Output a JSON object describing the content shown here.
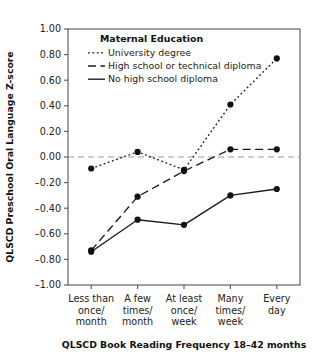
{
  "chart_data": {
    "type": "line",
    "title": "",
    "xlabel": "QLSCD Book Reading Frequency 18–42 months",
    "ylabel": "QLSCD Preschool Oral Language Z-score",
    "categories": [
      "Less than once/ month",
      "A few times/ month",
      "At least once/ week",
      "Many times/ week",
      "Every day"
    ],
    "category_lines": [
      [
        "Less than",
        "once/",
        "month"
      ],
      [
        "A few",
        "times/",
        "month"
      ],
      [
        "At least",
        "once/",
        "week"
      ],
      [
        "Many",
        "times/",
        "week"
      ],
      [
        "Every",
        "day"
      ]
    ],
    "ylim": [
      -1.0,
      1.0
    ],
    "ytick_labels": [
      "1.00",
      "0.80",
      "0.60",
      "0.40",
      "0.20",
      "0.00",
      "-0.20",
      "-0.40",
      "-0.60",
      "-0.80",
      "-1.00"
    ],
    "ytick_values": [
      1.0,
      0.8,
      0.6,
      0.4,
      0.2,
      0.0,
      -0.2,
      -0.4,
      -0.6,
      -0.8,
      -1.0
    ],
    "grid": false,
    "reference_line": 0.0,
    "legend_position": "top-left-inside",
    "legend_title": "Maternal Education",
    "series": [
      {
        "name": "University degree",
        "style": "dotted",
        "values": [
          -0.09,
          0.04,
          -0.1,
          0.41,
          0.77
        ]
      },
      {
        "name": "High school or technical diploma",
        "style": "dashed",
        "values": [
          -0.73,
          -0.31,
          -0.11,
          0.06,
          0.06
        ]
      },
      {
        "name": "No high school diploma",
        "style": "solid",
        "values": [
          -0.74,
          -0.49,
          -0.53,
          -0.3,
          -0.25
        ]
      }
    ],
    "colors": {
      "line": "#1a1a1a",
      "marker": "#111111",
      "axis": "#555555",
      "reference_line": "#999999",
      "background": "#ffffff"
    }
  }
}
